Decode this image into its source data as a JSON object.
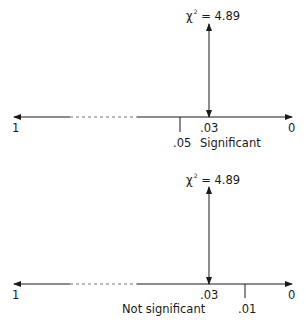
{
  "panels": [
    {
      "statistic": {
        "symbol": "χ",
        "exponent": "2",
        "equals": "= 4.89"
      },
      "axis": {
        "left_label": "1",
        "right_label": "0"
      },
      "p_value_label": ".03",
      "alpha_label": ".05",
      "result_label": "Significant"
    },
    {
      "statistic": {
        "symbol": "χ",
        "exponent": "2",
        "equals": "= 4.89"
      },
      "axis": {
        "left_label": "1",
        "right_label": "0"
      },
      "p_value_label": ".03",
      "alpha_label": ".01",
      "result_label": "Not significant"
    }
  ],
  "colors": {
    "line": "#1a1a1a",
    "dashed": "#777777"
  }
}
